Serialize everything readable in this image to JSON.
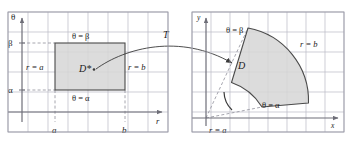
{
  "figure": {
    "colors": {
      "grid": "#b9b9c4",
      "panel_border": "#9a9aa6",
      "axis": "#6e6e78",
      "shape_fill": "#d6d6d6",
      "shape_stroke": "#4a4a4a",
      "dashed": "#8f8f9a",
      "text": "#1a1a1a",
      "arrow": "#3a3a3a"
    }
  },
  "left_panel": {
    "name": "r-theta-plane",
    "axes": {
      "vertical_label": "θ",
      "horizontal_label": "r"
    },
    "tick_labels": {
      "y_lower": "α",
      "y_upper": "β",
      "x_left": "a",
      "x_right": "b"
    },
    "region": {
      "label": "D*",
      "edge_top": "θ = β",
      "edge_bottom": "θ = α",
      "edge_left": "r = a",
      "edge_right": "r = b"
    }
  },
  "transform": {
    "label": "T"
  },
  "right_panel": {
    "name": "x-y-plane",
    "axes": {
      "vertical_label": "y",
      "horizontal_label": "x"
    },
    "region": {
      "label": "D",
      "edge_upper_ray": "θ = β",
      "edge_lower_ray": "θ = α",
      "edge_inner_arc": "r = a",
      "edge_outer_arc": "r = b"
    }
  }
}
